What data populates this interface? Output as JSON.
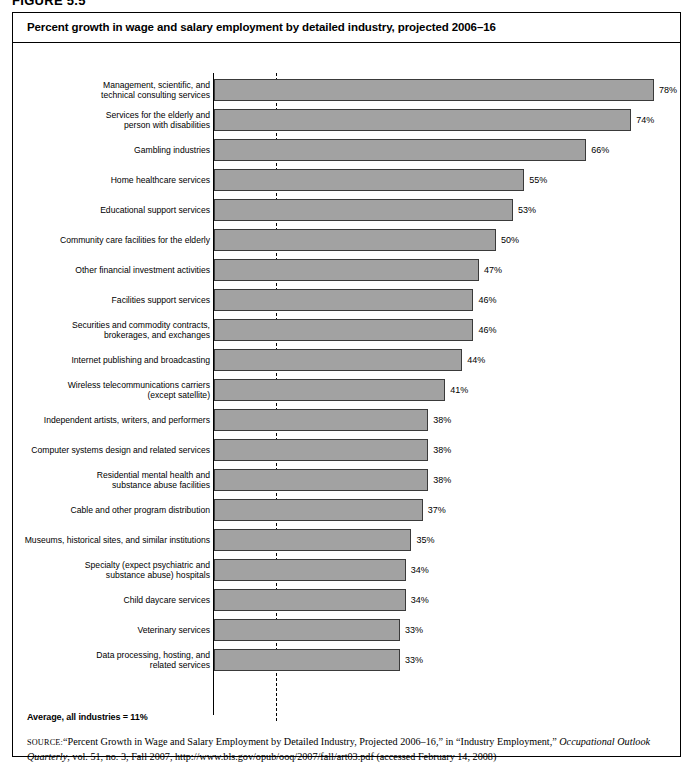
{
  "figure": {
    "number_label": "FIGURE 5.5"
  },
  "chart_title": "Percent growth in wage and salary employment by detailed industry, projected 2006–16",
  "average_note": "Average, all industries = 11%",
  "source": {
    "label": "source:",
    "text_part1": "“Percent Growth in Wage and Salary Employment by Detailed Industry, Projected 2006–16,” in “Industry Employment,” ",
    "italic1": "Occupational Outlook Quarterly",
    "text_part2": ", vol. 51, no. 3, Fall 2007, http://www.bls.gov/opub/ooq/2007/fall/art03.pdf (accessed February 14, 2008)"
  },
  "colors": {
    "bar_fill": "#a2a2a2",
    "bar_stroke": "#3a3a3a",
    "frame": "#000000"
  },
  "chart_data": {
    "type": "bar",
    "orientation": "horizontal",
    "title": "Percent growth in wage and salary employment by detailed industry, projected 2006–16",
    "xlabel": "",
    "ylabel": "",
    "xlim": [
      0,
      80
    ],
    "grid": false,
    "legend": false,
    "value_suffix": "%",
    "reference_line": {
      "label": "Average, all industries = 11%",
      "value": 11,
      "style": "dashed"
    },
    "categories": [
      "Management, scientific, and technical consulting services",
      "Services for the elderly and person with disabilities",
      "Gambling industries",
      "Home healthcare services",
      "Educational support services",
      "Community care facilities for the elderly",
      "Other financial investment activities",
      "Facilities support services",
      "Securities and commodity contracts, brokerages, and exchanges",
      "Internet publishing and broadcasting",
      "Wireless telecommunications carriers (except satellite)",
      "Independent artists, writers, and performers",
      "Computer systems design and related services",
      "Residential mental health and substance abuse facilities",
      "Cable and other program distribution",
      "Museums, historical sites, and similar institutions",
      "Specialty (expect psychiatric and substance abuse) hospitals",
      "Child daycare services",
      "Veterinary services",
      "Data processing, hosting, and related services"
    ],
    "values": [
      78,
      74,
      66,
      55,
      53,
      50,
      47,
      46,
      46,
      44,
      41,
      38,
      38,
      38,
      37,
      35,
      34,
      34,
      33,
      33
    ],
    "value_labels": [
      "78%",
      "74%",
      "66%",
      "55%",
      "53%",
      "50%",
      "47%",
      "46%",
      "46%",
      "44%",
      "41%",
      "38%",
      "38%",
      "38%",
      "37%",
      "35%",
      "34%",
      "34%",
      "33%",
      "33%"
    ]
  },
  "rows": [
    {
      "label_lines": [
        "Management, scientific, and",
        "technical consulting services"
      ],
      "value": 78,
      "value_label": "78%"
    },
    {
      "label_lines": [
        "Services for the elderly and",
        "person with disabilities"
      ],
      "value": 74,
      "value_label": "74%"
    },
    {
      "label_lines": [
        "Gambling industries"
      ],
      "value": 66,
      "value_label": "66%"
    },
    {
      "label_lines": [
        "Home healthcare services"
      ],
      "value": 55,
      "value_label": "55%"
    },
    {
      "label_lines": [
        "Educational support services"
      ],
      "value": 53,
      "value_label": "53%"
    },
    {
      "label_lines": [
        "Community care facilities for the elderly"
      ],
      "value": 50,
      "value_label": "50%"
    },
    {
      "label_lines": [
        "Other financial investment activities"
      ],
      "value": 47,
      "value_label": "47%"
    },
    {
      "label_lines": [
        "Facilities support services"
      ],
      "value": 46,
      "value_label": "46%"
    },
    {
      "label_lines": [
        "Securities and commodity contracts,",
        "brokerages, and exchanges"
      ],
      "value": 46,
      "value_label": "46%"
    },
    {
      "label_lines": [
        "Internet publishing and broadcasting"
      ],
      "value": 44,
      "value_label": "44%"
    },
    {
      "label_lines": [
        "Wireless telecommunications carriers",
        "(except satellite)"
      ],
      "value": 41,
      "value_label": "41%"
    },
    {
      "label_lines": [
        "Independent artists, writers, and performers"
      ],
      "value": 38,
      "value_label": "38%"
    },
    {
      "label_lines": [
        "Computer systems design and related services"
      ],
      "value": 38,
      "value_label": "38%"
    },
    {
      "label_lines": [
        "Residential mental health and",
        "substance abuse facilities"
      ],
      "value": 38,
      "value_label": "38%"
    },
    {
      "label_lines": [
        "Cable and other program distribution"
      ],
      "value": 37,
      "value_label": "37%"
    },
    {
      "label_lines": [
        "Museums, historical sites, and similar institutions"
      ],
      "value": 35,
      "value_label": "35%"
    },
    {
      "label_lines": [
        "Specialty (expect psychiatric and",
        "substance abuse) hospitals"
      ],
      "value": 34,
      "value_label": "34%"
    },
    {
      "label_lines": [
        "Child daycare services"
      ],
      "value": 34,
      "value_label": "34%"
    },
    {
      "label_lines": [
        "Veterinary services"
      ],
      "value": 33,
      "value_label": "33%"
    },
    {
      "label_lines": [
        "Data processing, hosting, and",
        "related services"
      ],
      "value": 33,
      "value_label": "33%"
    }
  ]
}
